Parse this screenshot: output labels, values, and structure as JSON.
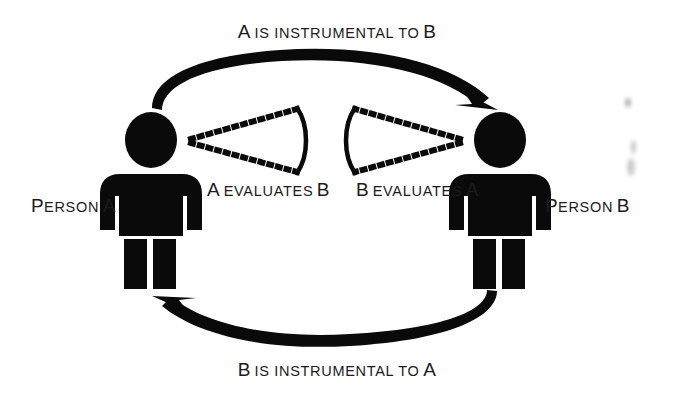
{
  "diagram": {
    "type": "cycle-diagram",
    "title_text": "A IS INSTRUMENTAL TO B",
    "background_color": "#ffffff",
    "ink_color": "#000000",
    "width": 674,
    "height": 396,
    "labels": {
      "top_arrow": {
        "lead": "A",
        "rest": "IS INSTRUMENTAL TO",
        "tail": "B",
        "full": "A IS INSTRUMENTAL TO B"
      },
      "bottom_arrow": {
        "lead": "B",
        "rest": "IS INSTRUMENTAL TO",
        "tail": "A",
        "full": "B IS INSTRUMENTAL TO A"
      },
      "person_a": {
        "lead": "P",
        "rest": "ERSON",
        "tail": "A",
        "full": "PERSON A"
      },
      "person_b": {
        "lead": "P",
        "rest": "ERSON",
        "tail": "B",
        "full": "PERSON B"
      },
      "eval_a_b": {
        "lead": "A",
        "rest": "EVALUATES",
        "tail": "B",
        "full": "A EVALUATES B"
      },
      "eval_b_a": {
        "lead": "B",
        "rest": "EVALUATES",
        "tail": "A",
        "full": "B EVALUATES A"
      }
    },
    "nodes": [
      {
        "id": "person-a",
        "name": "Person A",
        "side": "left"
      },
      {
        "id": "person-b",
        "name": "Person B",
        "side": "right"
      }
    ],
    "edges": [
      {
        "id": "top-arrow",
        "from": "person-a",
        "to": "person-b",
        "label": "A IS INSTRUMENTAL TO B",
        "style": "solid-curved-arrow",
        "direction": "left-to-right"
      },
      {
        "id": "bottom-arrow",
        "from": "person-b",
        "to": "person-a",
        "label": "B IS INSTRUMENTAL TO A",
        "style": "solid-curved-arrow",
        "direction": "right-to-left"
      },
      {
        "id": "gaze-a",
        "from": "person-a",
        "to": "person-b",
        "label": "A EVALUATES B",
        "style": "dotted-cone"
      },
      {
        "id": "gaze-b",
        "from": "person-b",
        "to": "person-a",
        "label": "B EVALUATES A",
        "style": "dotted-cone"
      }
    ]
  }
}
